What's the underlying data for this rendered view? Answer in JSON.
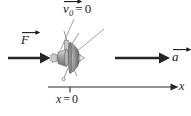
{
  "figure": {
    "background_color": "#ffffff",
    "width": 191,
    "height": 116
  },
  "labels": {
    "initial_velocity": {
      "symbol": "v",
      "subscript": "0",
      "equals": "=",
      "value": "0",
      "full_text": "v⃗0 = 0"
    },
    "force": {
      "symbol": "F",
      "full_text": "F⃗"
    },
    "acceleration": {
      "symbol": "a",
      "full_text": "a⃗"
    },
    "axis": {
      "symbol": "x",
      "full_text": "x"
    },
    "origin": {
      "symbol": "x",
      "equals": "=",
      "value": "0",
      "full_text": "x = 0"
    }
  },
  "colors": {
    "ink": "#1a1a1a",
    "arrow": "#262626",
    "axis": "#2b2b2b",
    "leader": "#8c8c8c",
    "probe_dark": "#5e5e5e",
    "probe_mid": "#8f8f8f",
    "probe_light": "#c4c4c4",
    "probe_highlight": "#e2e2e2"
  },
  "vectors": [
    {
      "name": "force-vector",
      "label": "F⃗",
      "direction": "right",
      "x_start": 8,
      "x_end": 50,
      "y": 58
    },
    {
      "name": "acceleration-vector",
      "label": "a⃗",
      "direction": "right",
      "x_start": 115,
      "x_end": 170,
      "y": 58
    }
  ],
  "axis": {
    "name": "x-axis",
    "x_start": 48,
    "x_end": 178,
    "y": 87,
    "tick_position": 70,
    "tick_label": "x = 0"
  },
  "object": {
    "name": "space-probe",
    "center_x": 70,
    "center_y": 57,
    "description": "space probe with dish, antenna booms and thruster nozzle"
  },
  "leader_lines": [
    {
      "name": "leader-line-left",
      "x1": 74,
      "y1": 19,
      "x2": 60,
      "y2": 50
    },
    {
      "name": "leader-line-right",
      "x1": 104,
      "y1": 29,
      "x2": 76,
      "y2": 52
    }
  ]
}
